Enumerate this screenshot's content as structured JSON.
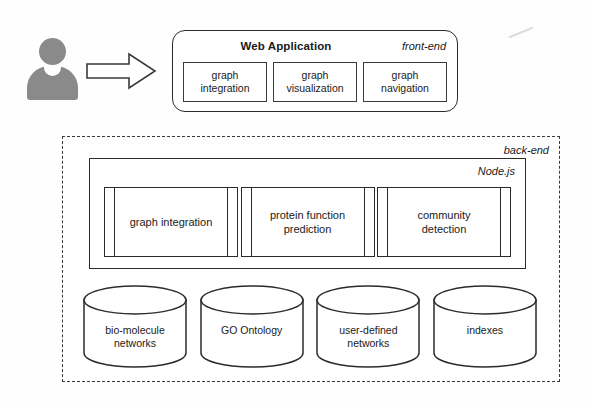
{
  "diagram": {
    "actor": {
      "icon": "user-silhouette-icon"
    },
    "flow_arrow": {
      "icon": "right-block-arrow-icon",
      "direction": "right"
    },
    "frontend": {
      "title": "Web Application",
      "tier_label": "front-end",
      "modules": [
        {
          "line1": "graph",
          "line2": "integration"
        },
        {
          "line1": "graph",
          "line2": "visualization"
        },
        {
          "line1": "graph",
          "line2": "navigation"
        }
      ]
    },
    "backend": {
      "tier_label": "back-end",
      "runtime": {
        "label": "Node.js",
        "modules": [
          {
            "line1": "graph integration",
            "line2": ""
          },
          {
            "line1": "protein function",
            "line2": "prediction"
          },
          {
            "line1": "community",
            "line2": "detection"
          }
        ]
      },
      "datastores": [
        {
          "line1": "bio-molecule",
          "line2": "networks"
        },
        {
          "line1": "GO Ontology",
          "line2": ""
        },
        {
          "line1": "user-defined",
          "line2": "networks"
        },
        {
          "line1": "indexes",
          "line2": ""
        }
      ]
    }
  },
  "colors": {
    "stroke": "#2b2b2b",
    "actor_fill": "#8a8a8a",
    "background": "#fefefe"
  }
}
